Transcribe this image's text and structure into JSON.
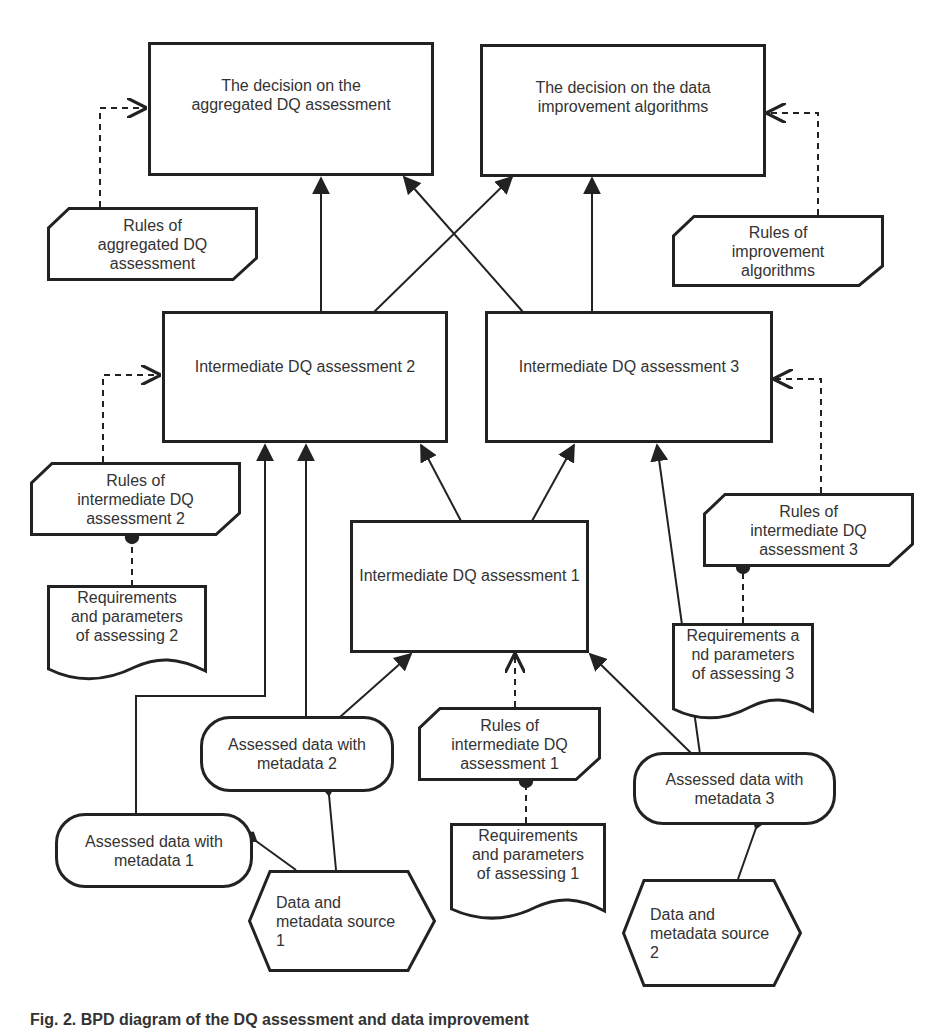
{
  "figure": {
    "type": "BPD-style data quality assessment diagram",
    "caption": "Fig. 2. BPD diagram of the DQ assessment and data improvement"
  },
  "nodes": {
    "decision_aggregated": "The decision on the\naggregated DQ assessment",
    "decision_improvement": "The decision on the data\nimprovement algorithms",
    "rules_aggregated": "Rules of\naggregated DQ\nassessment",
    "rules_improvement": "Rules of\nimprovement\nalgorithms",
    "intermediate_2": "Intermediate DQ assessment 2",
    "intermediate_3": "Intermediate DQ assessment 3",
    "intermediate_1": "Intermediate DQ assessment 1",
    "rules_intermediate_2": "Rules of\nintermediate DQ\nassessment 2",
    "rules_intermediate_3": "Rules of\nintermediate DQ\nassessment 3",
    "rules_intermediate_1": "Rules of\nintermediate DQ\nassessment 1",
    "requirements_2": "Requirements\nand parameters\nof assessing 2",
    "requirements_3": "Requirements a\nnd parameters\nof assessing 3",
    "requirements_1": "Requirements\nand parameters\nof assessing 1",
    "assessed_data_1": "Assessed data with\nmetadata 1",
    "assessed_data_2": "Assessed data with\nmetadata 2",
    "assessed_data_3": "Assessed data with\nmetadata 3",
    "source_1": "Data and\nmetadata source\n1",
    "source_2": "Data and\nmetadata source\n2"
  },
  "edges": [
    {
      "from": "intermediate_2",
      "to": "decision_aggregated",
      "style": "solid-arrow"
    },
    {
      "from": "intermediate_3",
      "to": "decision_aggregated",
      "style": "solid-arrow"
    },
    {
      "from": "intermediate_2",
      "to": "decision_improvement",
      "style": "solid-arrow"
    },
    {
      "from": "intermediate_3",
      "to": "decision_improvement",
      "style": "solid-arrow"
    },
    {
      "from": "rules_aggregated",
      "to": "decision_aggregated",
      "style": "dashed-open-arrow"
    },
    {
      "from": "rules_improvement",
      "to": "decision_improvement",
      "style": "dashed-open-arrow"
    },
    {
      "from": "rules_intermediate_2",
      "to": "intermediate_2",
      "style": "dashed-open-arrow"
    },
    {
      "from": "rules_intermediate_3",
      "to": "intermediate_3",
      "style": "dashed-open-arrow"
    },
    {
      "from": "rules_intermediate_1",
      "to": "intermediate_1",
      "style": "dashed-open-arrow"
    },
    {
      "from": "intermediate_1",
      "to": "intermediate_2",
      "style": "solid-arrow"
    },
    {
      "from": "intermediate_1",
      "to": "intermediate_3",
      "style": "solid-arrow"
    },
    {
      "from": "assessed_data_1",
      "to": "intermediate_2",
      "style": "solid-arrow"
    },
    {
      "from": "assessed_data_2",
      "to": "intermediate_2",
      "style": "solid-arrow"
    },
    {
      "from": "assessed_data_2",
      "to": "intermediate_1",
      "style": "solid-arrow"
    },
    {
      "from": "assessed_data_3",
      "to": "intermediate_1",
      "style": "solid-arrow"
    },
    {
      "from": "assessed_data_3",
      "to": "intermediate_3",
      "style": "solid-arrow"
    },
    {
      "from": "requirements_2",
      "to": "rules_intermediate_2",
      "style": "dashed-dot"
    },
    {
      "from": "requirements_3",
      "to": "rules_intermediate_3",
      "style": "dashed-dot"
    },
    {
      "from": "requirements_1",
      "to": "rules_intermediate_1",
      "style": "dashed-dot"
    },
    {
      "from": "source_1",
      "to": "assessed_data_1",
      "style": "solid-diamond"
    },
    {
      "from": "source_1",
      "to": "assessed_data_2",
      "style": "solid-diamond"
    },
    {
      "from": "source_2",
      "to": "assessed_data_3",
      "style": "solid-diamond"
    }
  ],
  "colors": {
    "stroke": "#222222",
    "text": "#333333",
    "background": "#ffffff"
  }
}
